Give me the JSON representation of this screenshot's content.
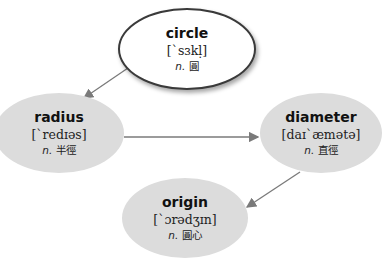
{
  "diagram": {
    "nodes": [
      {
        "id": "circle",
        "word": "circle",
        "ipa": "[ˋsɜkḷ]",
        "pos": "n.",
        "meaning": "圓"
      },
      {
        "id": "radius",
        "word": "radius",
        "ipa": "[ˋredɪəs]",
        "pos": "n.",
        "meaning": "半徑"
      },
      {
        "id": "diameter",
        "word": "diameter",
        "ipa": "[daɪˋæmətə]",
        "pos": "n.",
        "meaning": "直徑"
      },
      {
        "id": "origin",
        "word": "origin",
        "ipa": "[ˋɔrədʒɪn]",
        "pos": "n.",
        "meaning": "圓心"
      }
    ],
    "edges": [
      {
        "from": "circle",
        "to": "radius"
      },
      {
        "from": "radius",
        "to": "diameter"
      },
      {
        "from": "diameter",
        "to": "origin"
      }
    ],
    "colors": {
      "top_fill": "#ffffff",
      "node_fill": "#dcdcdc",
      "arrow": "#7a7a7a"
    }
  }
}
